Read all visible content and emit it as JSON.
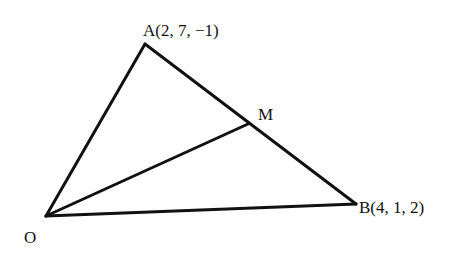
{
  "diagram": {
    "type": "triangle-vector-geometry",
    "stroke_color": "#111111",
    "background": "#ffffff",
    "points": {
      "O": {
        "label": "O",
        "x": 46,
        "y": 216
      },
      "A": {
        "label": "A(2, 7, −1)",
        "x": 145,
        "y": 44
      },
      "B": {
        "label": "B(4, 1, 2)",
        "x": 356,
        "y": 204
      },
      "M": {
        "label": "M",
        "x": 248,
        "y": 124
      }
    },
    "segments": [
      {
        "from": "O",
        "to": "A"
      },
      {
        "from": "A",
        "to": "B"
      },
      {
        "from": "O",
        "to": "B"
      },
      {
        "from": "O",
        "to": "M"
      }
    ]
  }
}
